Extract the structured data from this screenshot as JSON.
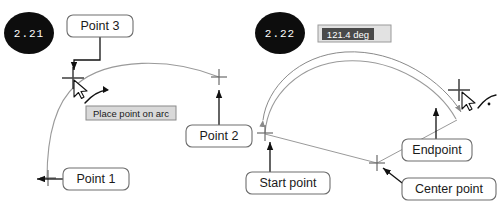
{
  "figures": [
    {
      "id": "fig-2-21",
      "badge": "2.21",
      "callouts": [
        {
          "name": "point-3",
          "label": "Point 3"
        },
        {
          "name": "point-2",
          "label": "Point 2"
        },
        {
          "name": "point-1",
          "label": "Point 1"
        }
      ],
      "tooltip": {
        "name": "place-point-on-arc-tooltip",
        "label": "Place point on arc"
      }
    },
    {
      "id": "fig-2-22",
      "badge": "2.22",
      "callouts": [
        {
          "name": "start-point",
          "label": "Start point"
        },
        {
          "name": "center-point",
          "label": "Center point"
        },
        {
          "name": "endpoint",
          "label": "Endpoint"
        }
      ],
      "dimension_input": {
        "name": "angle-input",
        "value": "121.4 deg"
      }
    }
  ],
  "colors": {
    "badge_fill": "#0d0d0d",
    "badge_text": "#ffffff",
    "callout_border": "#6e6e6e",
    "callout_fill": "#ffffff",
    "callout_text": "#1a1a1a",
    "tooltip_fill": "#d9d9d9",
    "tooltip_border": "#8a8a8a",
    "input_fill": "#e2e2e2",
    "input_selection": "#4a4a4a",
    "input_text": "#ffffff",
    "geometry_stroke": "#8e8e8e",
    "leader_stroke": "#111111",
    "marker_stroke": "#6b6b6b",
    "cursor_fill": "#ffffff",
    "cursor_stroke": "#111111"
  },
  "icons": {
    "crosshair": "crosshair-marker-icon",
    "cursor": "mouse-cursor-icon",
    "arc_hint": "arc-hint-icon",
    "arrowhead": "arrowhead-icon"
  }
}
